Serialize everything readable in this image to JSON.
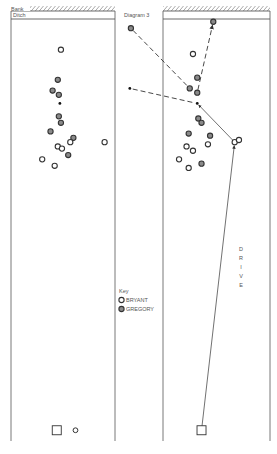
{
  "title": "Diagram 3",
  "labels": {
    "bank": "Bank",
    "ditch": "Ditch",
    "drive": "DRIVE",
    "key_title": "Key"
  },
  "legend": [
    {
      "name": "BRYANT",
      "style": "open"
    },
    {
      "name": "GREGORY",
      "style": "filled"
    }
  ],
  "colors": {
    "ink": "#333333",
    "gregory_fill": "#8a8a8a",
    "bryant_fill": "#ffffff",
    "hatch": "#555555"
  },
  "panels": [
    {
      "name": "before",
      "balls": [
        {
          "player": "BRYANT",
          "x": 0.48,
          "y": 0.09
        },
        {
          "player": "GREGORY",
          "x": 0.45,
          "y": 0.16
        },
        {
          "player": "GREGORY",
          "x": 0.4,
          "y": 0.185
        },
        {
          "player": "GREGORY",
          "x": 0.46,
          "y": 0.195
        },
        {
          "player": "GREGORY",
          "x": 0.46,
          "y": 0.245
        },
        {
          "player": "GREGORY",
          "x": 0.48,
          "y": 0.26
        },
        {
          "player": "GREGORY",
          "x": 0.38,
          "y": 0.28
        },
        {
          "player": "GREGORY",
          "x": 0.6,
          "y": 0.295
        },
        {
          "player": "BRYANT",
          "x": 0.57,
          "y": 0.305
        },
        {
          "player": "BRYANT",
          "x": 0.45,
          "y": 0.315
        },
        {
          "player": "BRYANT",
          "x": 0.49,
          "y": 0.32
        },
        {
          "player": "BRYANT",
          "x": 0.9,
          "y": 0.305
        },
        {
          "player": "BRYANT",
          "x": 0.3,
          "y": 0.345
        },
        {
          "player": "GREGORY",
          "x": 0.55,
          "y": 0.335
        },
        {
          "player": "BRYANT",
          "x": 0.42,
          "y": 0.36
        }
      ],
      "jack": {
        "x": 0.47,
        "y": 0.215
      },
      "mats": [
        {
          "x": 0.44,
          "y": 0.975
        }
      ],
      "extra_marker": {
        "player": "BRYANT",
        "x": 0.62,
        "y": 0.975
      }
    },
    {
      "name": "after",
      "balls": [
        {
          "player": "GREGORY",
          "x": 0.47,
          "y": 0.025
        },
        {
          "player": "BRYANT",
          "x": 0.28,
          "y": 0.1
        },
        {
          "player": "GREGORY",
          "x": 0.32,
          "y": 0.155
        },
        {
          "player": "GREGORY",
          "x": 0.25,
          "y": 0.18
        },
        {
          "player": "GREGORY",
          "x": 0.32,
          "y": 0.19
        },
        {
          "player": "GREGORY",
          "x": 0.33,
          "y": 0.25
        },
        {
          "player": "GREGORY",
          "x": 0.36,
          "y": 0.26
        },
        {
          "player": "GREGORY",
          "x": 0.24,
          "y": 0.285
        },
        {
          "player": "GREGORY",
          "x": 0.44,
          "y": 0.29
        },
        {
          "player": "BRYANT",
          "x": 0.22,
          "y": 0.315
        },
        {
          "player": "BRYANT",
          "x": 0.28,
          "y": 0.325
        },
        {
          "player": "BRYANT",
          "x": 0.42,
          "y": 0.31
        },
        {
          "player": "BRYANT",
          "x": 0.15,
          "y": 0.345
        },
        {
          "player": "GREGORY",
          "x": 0.36,
          "y": 0.355
        },
        {
          "player": "BRYANT",
          "x": 0.24,
          "y": 0.365
        },
        {
          "player": "BRYANT",
          "x": 0.67,
          "y": 0.305
        },
        {
          "player": "BRYANT",
          "x": 0.71,
          "y": 0.3
        }
      ],
      "jack": {
        "x": 0.32,
        "y": 0.215
      },
      "mats": [
        {
          "x": 0.36,
          "y": 0.975
        }
      ],
      "outside": [
        {
          "player": "GREGORY",
          "x": -0.3,
          "y": 0.04,
          "type": "ball"
        },
        {
          "player": "",
          "x": -0.31,
          "y": 0.18,
          "type": "jack"
        }
      ],
      "paths": [
        {
          "from": "outside0",
          "to": "ball3",
          "style": "dashed",
          "arrow": false
        },
        {
          "from": "outside1",
          "to": "jack",
          "style": "dashed",
          "arrow": false
        },
        {
          "from": "ball4",
          "to": "ball0",
          "style": "dashed",
          "arrow": true
        },
        {
          "from": "ball15",
          "to": "jack",
          "style": "solid",
          "arrow": true
        },
        {
          "from": "mat",
          "to": "ball15",
          "style": "solid",
          "arrow": true
        }
      ]
    }
  ]
}
